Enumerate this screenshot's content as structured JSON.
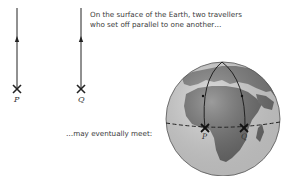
{
  "flat_diagram": {
    "caption_line1": "On the surface of the Earth, two travellers",
    "caption_line2": "who set off parallel to one another…",
    "point_p": "P",
    "point_q": "Q"
  },
  "globe_diagram": {
    "caption": "…may eventually meet:",
    "point_p": "P",
    "point_q": "Q"
  },
  "colors": {
    "ocean": "#d8d8d8",
    "land": "#6e6e6e",
    "line": "#222222"
  }
}
